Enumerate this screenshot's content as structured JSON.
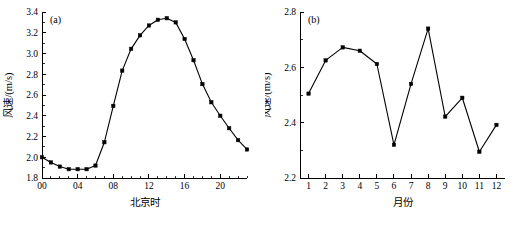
{
  "figure": {
    "background": "#ffffff",
    "line_color": "#000000",
    "marker_color": "#000000"
  },
  "panels": [
    {
      "tag": "(a)",
      "xlabel": "北京时",
      "ylabel": "风速/(m/s)",
      "x_ticks": [
        "00",
        "04",
        "08",
        "12",
        "16",
        "20"
      ],
      "y_ticks": [
        "1.8",
        "2.0",
        "2.2",
        "2.4",
        "2.6",
        "2.8",
        "3.0",
        "3.2",
        "3.4"
      ]
    },
    {
      "tag": "(b)",
      "xlabel": "月份",
      "ylabel": "风速/(m/s)",
      "x_ticks": [
        "1",
        "2",
        "3",
        "4",
        "5",
        "6",
        "7",
        "8",
        "9",
        "10",
        "11",
        "12"
      ],
      "y_ticks": [
        "2.2",
        "2.4",
        "2.6",
        "2.8"
      ]
    }
  ],
  "chart_data": [
    {
      "type": "line",
      "title": "(a)",
      "xlabel": "北京时",
      "ylabel": "风速/(m/s)",
      "xlim": [
        0,
        23
      ],
      "ylim": [
        1.8,
        3.4
      ],
      "x_tick_values": [
        0,
        4,
        8,
        12,
        16,
        20
      ],
      "x_tick_labels": [
        "00",
        "04",
        "08",
        "12",
        "16",
        "20"
      ],
      "y_tick_values": [
        1.8,
        2.0,
        2.2,
        2.4,
        2.6,
        2.8,
        3.0,
        3.2,
        3.4
      ],
      "grid": false,
      "legend": "none",
      "marker": "filled-square",
      "x": [
        0,
        1,
        2,
        3,
        4,
        5,
        6,
        7,
        8,
        9,
        10,
        11,
        12,
        13,
        14,
        15,
        16,
        17,
        18,
        19,
        20,
        21,
        22,
        23
      ],
      "values": [
        2.0,
        1.95,
        1.91,
        1.885,
        1.885,
        1.885,
        1.92,
        2.145,
        2.495,
        2.835,
        3.045,
        3.175,
        3.27,
        3.325,
        3.34,
        3.3,
        3.14,
        2.935,
        2.705,
        2.53,
        2.4,
        2.28,
        2.165,
        2.075
      ]
    },
    {
      "type": "line",
      "title": "(b)",
      "xlabel": "月份",
      "ylabel": "风速/(m/s)",
      "xlim": [
        0.5,
        12.5
      ],
      "ylim": [
        2.2,
        2.8
      ],
      "x_tick_values": [
        1,
        2,
        3,
        4,
        5,
        6,
        7,
        8,
        9,
        10,
        11,
        12
      ],
      "x_tick_labels": [
        "1",
        "2",
        "3",
        "4",
        "5",
        "6",
        "7",
        "8",
        "9",
        "10",
        "11",
        "12"
      ],
      "y_tick_values": [
        2.2,
        2.4,
        2.6,
        2.8
      ],
      "grid": false,
      "legend": "none",
      "marker": "filled-square",
      "x": [
        1,
        2,
        3,
        4,
        5,
        6,
        7,
        8,
        9,
        10,
        11,
        12
      ],
      "values": [
        2.505,
        2.625,
        2.672,
        2.66,
        2.612,
        2.32,
        2.54,
        2.74,
        2.422,
        2.49,
        2.295,
        2.392
      ]
    }
  ]
}
